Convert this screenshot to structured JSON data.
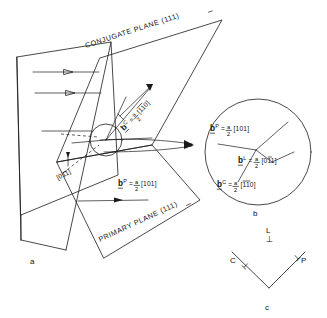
{
  "figure": {
    "panels": [
      {
        "id": "a",
        "label": "a"
      },
      {
        "id": "b",
        "label": "b"
      },
      {
        "id": "c",
        "label": "c"
      }
    ]
  },
  "panel_a": {
    "conjugate_plane_label": "CONJUGATE PLANE (111)",
    "conjugate_plane_indices": {
      "h": "1",
      "k": "1",
      "l": "1",
      "bar_on": "k"
    },
    "primary_plane_label": "PRIMARY PLANE (111)",
    "primary_plane_indices": {
      "h": "1",
      "k": "1",
      "l": "1",
      "bar_on": "l"
    },
    "direction_label": "[011]",
    "direction_label_bar_on": "k",
    "burgers_conjugate": {
      "symbol": "b",
      "superscript": "C",
      "equals": "=",
      "frac_num": "a",
      "frac_den": "2",
      "bracket": "[110]",
      "bars": "11"
    },
    "burgers_primary": {
      "symbol": "b",
      "superscript": "P",
      "equals": "=",
      "frac_num": "a",
      "frac_den": "2",
      "bracket": "[101]",
      "bars": ""
    },
    "panel_label": "a"
  },
  "panel_b": {
    "burgers_primary": {
      "symbol": "b",
      "superscript": "P",
      "equals": "=",
      "frac_num": "a",
      "frac_den": "2",
      "bracket": "[101]"
    },
    "burgers_lock": {
      "symbol": "b",
      "superscript": "L",
      "equals": "=",
      "frac_num": "a",
      "frac_den": "2",
      "bracket": "[011]",
      "bar_on_index": 2
    },
    "burgers_conjugate": {
      "symbol": "b",
      "superscript": "C",
      "equals": "=",
      "frac_num": "a",
      "frac_den": "2",
      "bracket": "[110]",
      "bars": "11"
    },
    "panel_label": "b"
  },
  "panel_c": {
    "lock_label": "L",
    "conjugate_label": "C",
    "primary_label": "P",
    "symbol": "⊥",
    "panel_label": "c"
  },
  "colors": {
    "background": "#ffffff",
    "ink": "#1a1a1a",
    "text": "#111111"
  }
}
